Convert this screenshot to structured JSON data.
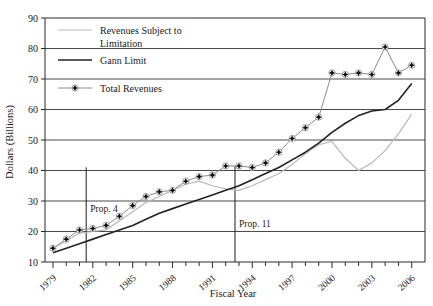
{
  "chart_data": {
    "type": "line",
    "title": "",
    "xlabel": "Fiscal Year",
    "ylabel": "Dollars (Billions)",
    "xlim": [
      1978.4,
      2007.0
    ],
    "ylim": [
      10,
      90
    ],
    "yticks": [
      10,
      20,
      30,
      40,
      50,
      60,
      70,
      80,
      90
    ],
    "xticks_major": [
      1979,
      1982,
      1985,
      1988,
      1991,
      1994,
      1997,
      2000,
      2003,
      2006
    ],
    "xticks_minor_step": 1,
    "grid": "horizontal",
    "legend_position": "top-left",
    "x": [
      1979,
      1980,
      1981,
      1982,
      1983,
      1984,
      1985,
      1986,
      1987,
      1988,
      1989,
      1990,
      1991,
      1992,
      1993,
      1994,
      1995,
      1996,
      1997,
      1998,
      1999,
      2000,
      2001,
      2002,
      2003,
      2004,
      2005,
      2006
    ],
    "series": [
      {
        "name": "Revenues Subject to Limitation",
        "color": "#b9b9b9",
        "style": "line",
        "values": [
          14.5,
          17.0,
          19.5,
          20.0,
          20.5,
          23.5,
          26.5,
          29.5,
          31.5,
          33.5,
          35.5,
          36.5,
          35.0,
          34.0,
          33.5,
          35.0,
          37.0,
          39.0,
          42.0,
          45.5,
          48.5,
          49.5,
          44.0,
          40.0,
          42.5,
          46.5,
          52.0,
          58.5
        ]
      },
      {
        "name": "Gann Limit",
        "color": "#222222",
        "style": "line",
        "values": [
          13.0,
          14.5,
          16.0,
          17.5,
          19.0,
          20.5,
          22.0,
          24.0,
          26.0,
          27.5,
          29.0,
          30.5,
          32.0,
          33.5,
          35.0,
          37.0,
          39.0,
          41.0,
          43.5,
          46.0,
          49.0,
          52.5,
          55.5,
          58.0,
          59.5,
          60.0,
          63.0,
          68.5
        ]
      },
      {
        "name": "Total Revenues",
        "color": "#8c8c8c",
        "style": "line+marker",
        "values": [
          14.5,
          17.5,
          20.5,
          21.0,
          22.0,
          25.0,
          28.5,
          31.5,
          33.0,
          33.5,
          36.5,
          38.0,
          38.5,
          41.5,
          41.5,
          41.0,
          42.5,
          46.0,
          50.5,
          54.0,
          57.5,
          72.0,
          71.5,
          72.0,
          71.5,
          80.5,
          72.0,
          74.5
        ]
      }
    ],
    "annotations": [
      {
        "label": "Prop. 4",
        "x_year": 1981.5,
        "y_value": 26.5,
        "rule_from": 10,
        "rule_to": 41.0
      },
      {
        "label": "Prop. 11",
        "x_year": 1992.7,
        "y_value": 21.5,
        "rule_from": 10,
        "rule_to": 41.5
      }
    ]
  },
  "legend": {
    "items": [
      {
        "label": "Revenues Subject to",
        "label2": "Limitation"
      },
      {
        "label": "Gann Limit"
      },
      {
        "label": "Total Revenues"
      }
    ]
  },
  "axis": {
    "y_title": "Dollars (Billions)",
    "x_title": "Fiscal Year",
    "y_labels": [
      "90",
      "80",
      "70",
      "60",
      "50",
      "40",
      "30",
      "20",
      "10"
    ],
    "x_labels": [
      "1979",
      "1982",
      "1985",
      "1988",
      "1991",
      "1994",
      "1997",
      "2000",
      "2003",
      "2006"
    ]
  },
  "annotations": {
    "prop4": "Prop. 4",
    "prop11": "Prop. 11"
  }
}
